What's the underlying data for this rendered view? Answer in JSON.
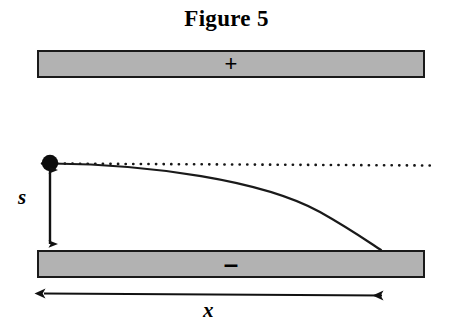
{
  "figure": {
    "title": "Figure 5",
    "type": "physics-diagram"
  },
  "plates": {
    "top": {
      "name": "positive-plate",
      "sign": "+",
      "fill_color": "#b2b2b2",
      "border_color": "#1a1a1a"
    },
    "bottom": {
      "name": "negative-plate",
      "sign": "–",
      "fill_color": "#b2b2b2",
      "border_color": "#1a1a1a"
    }
  },
  "labels": {
    "vertical_distance": "s",
    "horizontal_distance": "x"
  },
  "elements": {
    "particle": "charged particle",
    "dotted_line": "undeflected path",
    "trajectory": "parabolic deflected path"
  },
  "geometry": {
    "particle_x": 50,
    "particle_y": 163,
    "landing_x": 381,
    "landing_y": 250,
    "plate_left": 37,
    "plate_right": 425,
    "dotted_line_end": 431,
    "arrow_s_top": 165,
    "arrow_s_bottom": 250,
    "arrow_x_left": 38,
    "arrow_x_right": 388,
    "arrow_x_y": 294
  }
}
